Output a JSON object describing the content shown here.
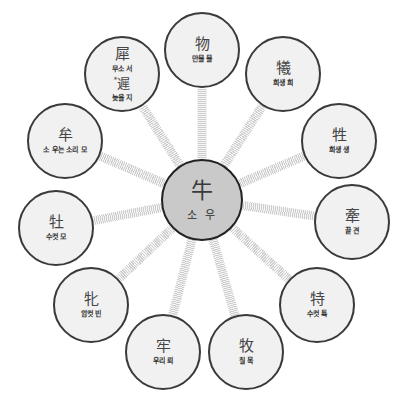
{
  "diagram": {
    "center": {
      "hanja": "牛",
      "meaning": "소 우",
      "x": 202,
      "y": 200,
      "r": 41
    },
    "node_radius": 38,
    "nodes": [
      {
        "hanja": "物",
        "meaning": "만물 물",
        "x": 202,
        "y": 50
      },
      {
        "hanja": "犧",
        "meaning": "희생 희",
        "x": 283,
        "y": 74
      },
      {
        "hanja": "牲",
        "meaning": "희생 생",
        "x": 339,
        "y": 141
      },
      {
        "hanja": "牽",
        "meaning": "끌 견",
        "x": 352,
        "y": 222
      },
      {
        "hanja": "特",
        "meaning": "수컷 특",
        "x": 317,
        "y": 305
      },
      {
        "hanja": "牧",
        "meaning": "칠 목",
        "x": 246,
        "y": 352
      },
      {
        "hanja": "牢",
        "meaning": "우리 뢰",
        "x": 163,
        "y": 352
      },
      {
        "hanja": "牝",
        "meaning": "암컷 빈",
        "x": 91,
        "y": 305
      },
      {
        "hanja": "牡",
        "meaning": "수컷 모",
        "x": 56,
        "y": 228
      },
      {
        "hanja": "牟",
        "meaning": "소 우는 소리 모",
        "x": 65,
        "y": 141
      },
      {
        "hanja": "犀",
        "meaning": "무소 서",
        "hanja2_mark": "*",
        "hanja2": "遲",
        "meaning2": "늦을 지",
        "x": 122,
        "y": 74
      }
    ],
    "colors": {
      "center_fill": "#c9c9c9",
      "node_fill": "#f1f1f1",
      "border": "#3a3a3a",
      "connector": "#c8c8c8"
    }
  }
}
